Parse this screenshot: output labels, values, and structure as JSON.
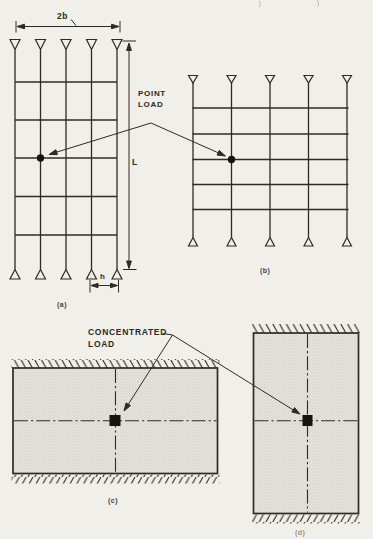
{
  "figure": {
    "type": "structural-engineering-figure",
    "colors": {
      "paper": "#f1efe9",
      "ink": "#2e2b26",
      "plate_fill": "#e7e5df",
      "stipple_dot": "#bdbab2",
      "load_marker": "#16140f"
    },
    "labels": {
      "dim_width": "2b",
      "dim_length": "L",
      "dim_spacing": "h",
      "point_load_line1": "POINT",
      "point_load_line2": "LOAD",
      "concentrated_load_line1": "CONCENTRATED",
      "concentrated_load_line2": "LOAD",
      "caption_a": "(a)",
      "caption_b": "(b)",
      "caption_c": "(c)",
      "caption_d": "(d)"
    },
    "panels": {
      "a": {
        "caption": "(a)",
        "kind": "grillage",
        "orientation": "vertical",
        "longitudinal_beams": 5,
        "cross_beams": 5,
        "supports": "pinned-triangles-top-and-bottom",
        "load_marker": "point-load-dot"
      },
      "b": {
        "caption": "(b)",
        "kind": "grillage",
        "orientation": "square",
        "longitudinal_beams": 5,
        "cross_beams": 5,
        "supports": "pinned-triangles-top-and-bottom",
        "load_marker": "point-load-dot"
      },
      "c": {
        "caption": "(c)",
        "kind": "plate",
        "orientation": "landscape",
        "edges": "hatched-top-and-bottom",
        "centerlines": "dash-dot-cross",
        "load_marker": "concentrated-load-square"
      },
      "d": {
        "caption": "(d)",
        "kind": "plate",
        "orientation": "portrait",
        "edges": "hatched-top-and-bottom",
        "centerlines": "dash-dot-cross",
        "load_marker": "concentrated-load-square"
      }
    }
  }
}
